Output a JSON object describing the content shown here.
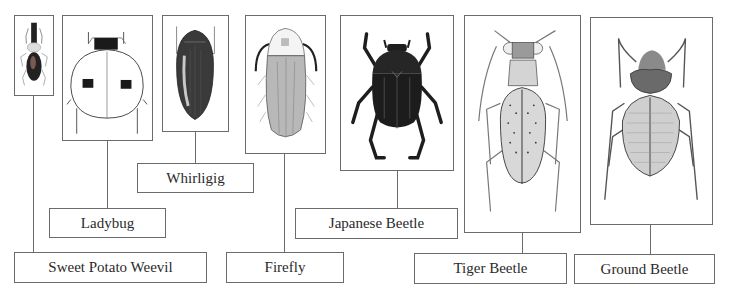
{
  "diagram": {
    "type": "labeled-illustration",
    "colors": {
      "line": "#6b6b6b",
      "text": "#2a2a2a",
      "background": "#ffffff"
    },
    "beetles": [
      {
        "id": "sweet-potato-weevil",
        "label": "Sweet Potato Weevil",
        "icon": "weevil-illustration"
      },
      {
        "id": "ladybug",
        "label": "Ladybug",
        "icon": "ladybug-illustration"
      },
      {
        "id": "whirligig",
        "label": "Whirligig",
        "icon": "whirligig-beetle-illustration"
      },
      {
        "id": "firefly",
        "label": "Firefly",
        "icon": "firefly-illustration"
      },
      {
        "id": "japanese-beetle",
        "label": "Japanese Beetle",
        "icon": "japanese-beetle-illustration"
      },
      {
        "id": "tiger-beetle",
        "label": "Tiger Beetle",
        "icon": "tiger-beetle-illustration"
      },
      {
        "id": "ground-beetle",
        "label": "Ground Beetle",
        "icon": "ground-beetle-illustration"
      }
    ]
  }
}
